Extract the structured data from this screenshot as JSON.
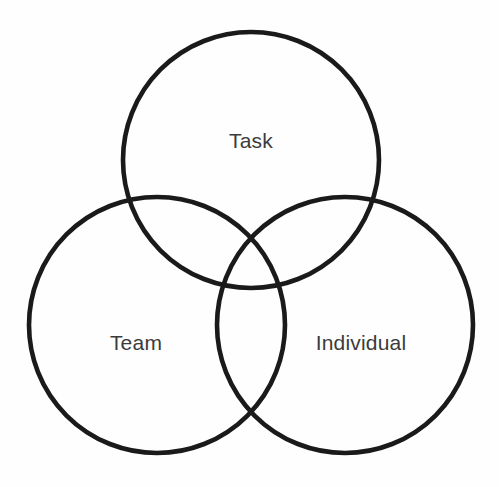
{
  "diagram": {
    "type": "venn",
    "title": "",
    "canvas": {
      "width": 499,
      "height": 487,
      "background": "#fefefe"
    },
    "style": {
      "stroke_color": "#1a1a1a",
      "stroke_width": 4.6,
      "label_color": "#3b3b3b",
      "label_font_size": 21,
      "fill": "none"
    },
    "sets": [
      {
        "id": "task",
        "label": "Task",
        "cx": 251,
        "cy": 160,
        "r": 128,
        "label_x": 251,
        "label_y": 142
      },
      {
        "id": "team",
        "label": "Team",
        "cx": 157,
        "cy": 325,
        "r": 128,
        "label_x": 136,
        "label_y": 344
      },
      {
        "id": "individual",
        "label": "Individual",
        "cx": 345,
        "cy": 325,
        "r": 128,
        "label_x": 361,
        "label_y": 344
      }
    ]
  },
  "chart_data": {
    "type": "venn",
    "title": "",
    "subtitle": "",
    "xlabel": "",
    "ylabel": "",
    "legend": [],
    "annotations": [],
    "categories": [
      "Task",
      "Team",
      "Individual"
    ],
    "set_count": 3,
    "regions": [
      {
        "sets": [
          "Task"
        ],
        "label": "Task"
      },
      {
        "sets": [
          "Team"
        ],
        "label": "Team"
      },
      {
        "sets": [
          "Individual"
        ],
        "label": "Individual"
      },
      {
        "sets": [
          "Task",
          "Team"
        ],
        "label": ""
      },
      {
        "sets": [
          "Task",
          "Individual"
        ],
        "label": ""
      },
      {
        "sets": [
          "Team",
          "Individual"
        ],
        "label": ""
      },
      {
        "sets": [
          "Task",
          "Team",
          "Individual"
        ],
        "label": ""
      }
    ]
  }
}
